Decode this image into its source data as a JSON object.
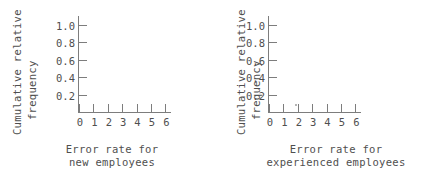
{
  "figure": {
    "background": "#ffffff",
    "axis_color": "#7d7d7d",
    "text_color": "#4f4f4f"
  },
  "panels": [
    {
      "id": "new-employees",
      "ytitle_line1": "Cumulative relative",
      "ytitle_line2": "frequency",
      "xtitle_line1": "Error rate for",
      "xtitle_line2": "new employees",
      "yticks": [
        "1.0",
        "0.8",
        "0.6",
        "0.4",
        "0.2"
      ],
      "xticks": [
        "0",
        "1",
        "2",
        "3",
        "4",
        "5",
        "6"
      ]
    },
    {
      "id": "experienced-employees",
      "ytitle_line1": "Cumulative relative",
      "ytitle_line2": "frequency",
      "xtitle_line1": "Error rate for",
      "xtitle_line2": "experienced employees",
      "yticks": [
        "1.0",
        "0.8",
        "0.6",
        "0.4",
        "0.2"
      ],
      "xticks": [
        "0",
        "1",
        "2",
        "3",
        "4",
        "5",
        "6"
      ]
    }
  ],
  "chart_data": [
    {
      "type": "line",
      "title": "",
      "subtitle": "",
      "xlabel": "Error rate for new employees",
      "ylabel": "Cumulative relative frequency",
      "xlim": [
        0,
        6.4
      ],
      "ylim": [
        0,
        1.1
      ],
      "xticks": [
        0,
        1,
        2,
        3,
        4,
        5,
        6
      ],
      "xtick_labels": [
        "0",
        "1",
        "2",
        "3",
        "4",
        "5",
        "6"
      ],
      "yticks": [
        0.2,
        0.4,
        0.6,
        0.8,
        1.0
      ],
      "ytick_labels": [
        "0.2",
        "0.4",
        "0.6",
        "0.8",
        "1.0"
      ],
      "grid": false,
      "legend": false,
      "series": [
        {
          "name": "cumulative relative frequency",
          "x": [],
          "y": []
        }
      ],
      "annotations": [],
      "note": "Blank axes - no data plotted (answer grid for student to draw on)"
    },
    {
      "type": "line",
      "title": "",
      "subtitle": "",
      "xlabel": "Error rate for experienced employees",
      "ylabel": "Cumulative relative frequency",
      "xlim": [
        0,
        6.4
      ],
      "ylim": [
        0,
        1.1
      ],
      "xticks": [
        0,
        1,
        2,
        3,
        4,
        5,
        6
      ],
      "xtick_labels": [
        "0",
        "1",
        "2",
        "3",
        "4",
        "5",
        "6"
      ],
      "yticks": [
        0.2,
        0.4,
        0.6,
        0.8,
        1.0
      ],
      "ytick_labels": [
        "0.2",
        "0.4",
        "0.6",
        "0.8",
        "1.0"
      ],
      "grid": false,
      "legend": false,
      "series": [
        {
          "name": "cumulative relative frequency",
          "x": [],
          "y": []
        }
      ],
      "annotations": [],
      "note": "Blank axes - no data plotted (answer grid for student to draw on)"
    }
  ]
}
